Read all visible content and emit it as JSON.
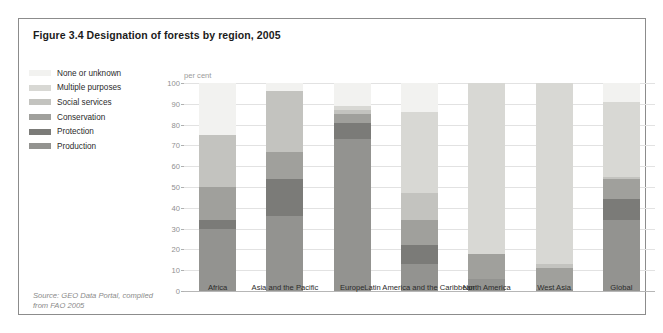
{
  "figure": {
    "title": "Figure 3.4 Designation of forests by region, 2005",
    "source": "Source: GEO Data Portal, compiled from FAO 2005"
  },
  "legend": {
    "items": [
      {
        "label": "None or unknown",
        "color": "#f2f2f0",
        "icon": "legend-swatch-icon"
      },
      {
        "label": "Multiple purposes",
        "color": "#d8d8d4",
        "icon": "legend-swatch-icon"
      },
      {
        "label": "Social services",
        "color": "#c3c3bf",
        "icon": "legend-swatch-icon"
      },
      {
        "label": "Conservation",
        "color": "#a0a09c",
        "icon": "legend-swatch-icon"
      },
      {
        "label": "Protection",
        "color": "#7b7b78",
        "icon": "legend-swatch-icon"
      },
      {
        "label": "Production",
        "color": "#939390",
        "icon": "legend-swatch-icon"
      }
    ]
  },
  "chart_data": {
    "type": "bar",
    "stacked": true,
    "title": "Figure 3.4 Designation of forests by region, 2005",
    "xlabel": "",
    "ylabel": "per cent",
    "ylim": [
      0,
      100
    ],
    "yticks": [
      0,
      10,
      20,
      30,
      40,
      50,
      60,
      70,
      80,
      90,
      100
    ],
    "ytick_labels": [
      "0",
      "10",
      "20",
      "30",
      "40",
      "50",
      "60",
      "70",
      "80",
      "90",
      "100"
    ],
    "grid": true,
    "legend_position": "left",
    "categories": [
      "Africa",
      "Asia and the Pacific",
      "Europe",
      "Latin America and the Caribbean",
      "North America",
      "West Asia",
      "Global"
    ],
    "series": [
      {
        "name": "Production",
        "color": "#939390",
        "values": [
          30,
          36,
          73,
          13,
          6,
          1,
          34
        ]
      },
      {
        "name": "Protection",
        "color": "#7b7b78",
        "values": [
          4,
          18,
          8,
          9,
          0,
          0,
          10
        ]
      },
      {
        "name": "Conservation",
        "color": "#a0a09c",
        "values": [
          16,
          13,
          4,
          12,
          12,
          10,
          10
        ]
      },
      {
        "name": "Social services",
        "color": "#c3c3bf",
        "values": [
          25,
          29,
          2,
          13,
          0,
          2,
          1
        ]
      },
      {
        "name": "Multiple purposes",
        "color": "#d8d8d4",
        "values": [
          0,
          0,
          2,
          39,
          82,
          87,
          36
        ]
      },
      {
        "name": "None or unknown",
        "color": "#f2f2f0",
        "values": [
          25,
          4,
          11,
          14,
          0,
          0,
          9
        ]
      }
    ]
  }
}
